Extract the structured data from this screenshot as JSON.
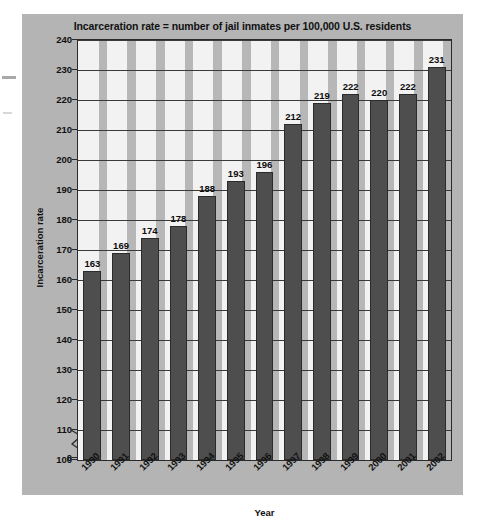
{
  "chart_data": {
    "type": "bar",
    "title": "Incarceration rate = number of jail inmates per 100,000 U.S. residents",
    "xlabel": "Year",
    "ylabel": "Incarceration rate",
    "categories": [
      "1990",
      "1991",
      "1992",
      "1993",
      "1994",
      "1995",
      "1996",
      "1997",
      "1998",
      "1999",
      "2000",
      "2001",
      "2002"
    ],
    "values": [
      163,
      169,
      174,
      178,
      188,
      193,
      196,
      212,
      219,
      222,
      220,
      222,
      231
    ],
    "ylim": [
      100,
      240
    ],
    "y_axis_broken": true,
    "y_break_label": "0",
    "yticks": [
      100,
      110,
      120,
      130,
      140,
      150,
      160,
      170,
      180,
      190,
      200,
      210,
      220,
      230,
      240
    ],
    "ytick_labels": [
      "100",
      "110",
      "120",
      "130",
      "140",
      "150",
      "160",
      "170",
      "180",
      "190",
      "200",
      "210",
      "220",
      "230",
      "240"
    ],
    "grid": true,
    "legend": null,
    "colors": {
      "bar": "#4e4e4e",
      "bar_edge": "#2b2b2b",
      "panel_background": "#b4b4b4",
      "plot_background": "#f2f2f2",
      "band": "#b7b7b7",
      "gridline": "#3a3a3a",
      "text": "#111111"
    }
  }
}
